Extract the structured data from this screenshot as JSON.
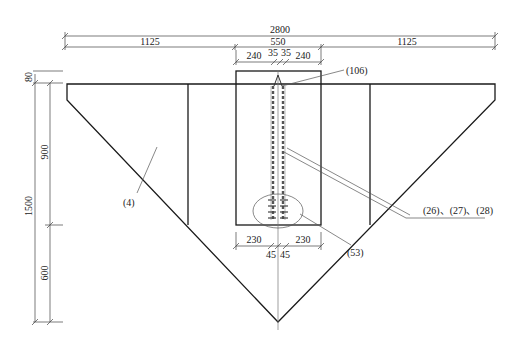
{
  "dimensions": {
    "top": {
      "overall": "2800",
      "left": "1125",
      "center": "550",
      "right": "1125",
      "center_sub": [
        "240",
        "35",
        "35",
        "240"
      ]
    },
    "bottom": {
      "center_sub": [
        "230",
        "45",
        "45",
        "230"
      ]
    },
    "left_side": {
      "top_offset": "80",
      "overall": "1500",
      "upper": "900",
      "lower": "600"
    }
  },
  "labels": {
    "plate": "(4)",
    "top_part": "(106)",
    "tendons": "(26)、(27)、(28)",
    "anchors": "(53)"
  },
  "colors": {
    "line": "#1a1a1a",
    "background": "#ffffff"
  }
}
